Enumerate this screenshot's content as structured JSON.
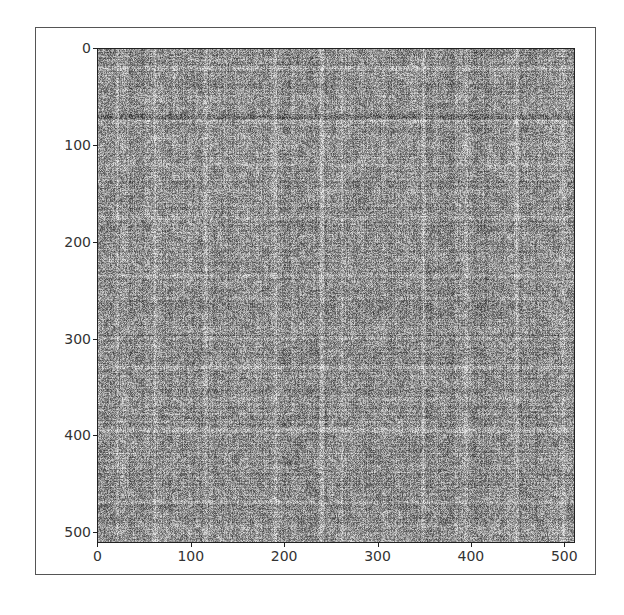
{
  "chart_data": {
    "type": "heatmap",
    "title": "",
    "xlabel": "",
    "ylabel": "",
    "colormap": "gray",
    "shape": [
      512,
      512
    ],
    "xlim": [
      0,
      512
    ],
    "ylim": [
      512,
      0
    ],
    "x_ticks": [
      0,
      100,
      200,
      300,
      400,
      500
    ],
    "y_ticks": [
      0,
      100,
      200,
      300,
      400,
      500
    ],
    "x_tick_labels": [
      "0",
      "100",
      "200",
      "300",
      "400",
      "500"
    ],
    "y_tick_labels": [
      "0",
      "100",
      "200",
      "300",
      "400",
      "500"
    ],
    "grid": false,
    "legend": null,
    "bright_columns": [
      20,
      60,
      115,
      190,
      240,
      262,
      350,
      395,
      450,
      500
    ],
    "bright_rows": [
      20,
      75,
      120,
      175,
      235,
      300,
      330,
      395,
      420,
      470
    ],
    "dark_rows": [
      70,
      300,
      420
    ]
  },
  "figure": {
    "background": "#ffffff",
    "frame_color": "#555555",
    "text_color": "#333333"
  }
}
